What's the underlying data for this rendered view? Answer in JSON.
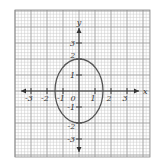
{
  "chart_data": {
    "type": "line",
    "title": "",
    "xlabel": "x",
    "ylabel": "y",
    "xlim": [
      -4,
      4.4
    ],
    "ylim": [
      -4.2,
      4.8
    ],
    "grid": true,
    "minor_grid_subdivisions": 5,
    "x_ticks": [
      -3,
      -2,
      -1,
      1,
      2,
      3
    ],
    "x_tick_labels": [
      "-3",
      "-2",
      "-1",
      "1",
      "2",
      "3"
    ],
    "y_ticks": [
      -3,
      -1,
      1,
      3
    ],
    "y_tick_labels": [
      "-3",
      "-1",
      "1",
      "3"
    ],
    "y_tick_marks": [
      -3,
      -2,
      -1,
      1,
      2,
      3
    ],
    "extra_labels": [
      {
        "text": "2",
        "x": -0.1,
        "y": 2
      },
      {
        "text": "-2",
        "x": -0.1,
        "y": -2
      }
    ],
    "origin_label": "0",
    "series": [
      {
        "name": "ellipse",
        "shape": "ellipse",
        "center": [
          0,
          0
        ],
        "semi_axis_x": 1.5,
        "semi_axis_y": 2,
        "color": "#555555"
      }
    ]
  }
}
